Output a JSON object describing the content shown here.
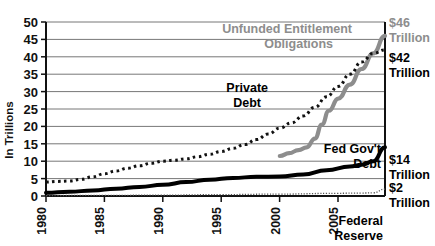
{
  "chart_data": {
    "type": "line",
    "title": "",
    "xlabel": "",
    "ylabel": "In Trillions",
    "xlim": [
      1980,
      2009
    ],
    "ylim": [
      0,
      50
    ],
    "grid": true,
    "legend_position": "inline-annotations",
    "x_ticks": [
      "1980",
      "1985",
      "1990",
      "1995",
      "2000",
      "2005"
    ],
    "x_tick_values": [
      1980,
      1985,
      1990,
      1995,
      2000,
      2005
    ],
    "y_ticks": [
      "0",
      "5",
      "10",
      "15",
      "20",
      "25",
      "30",
      "35",
      "40",
      "45",
      "50"
    ],
    "y_tick_values": [
      0,
      5,
      10,
      15,
      20,
      25,
      30,
      35,
      40,
      45,
      50
    ],
    "series": [
      {
        "name": "Unfunded Entitlement Obligations",
        "style": "thick-gray-line",
        "color": "#8d8d8d",
        "x": [
          2000,
          2000.8,
          2001.6,
          2002.3,
          2003.0,
          2003.6,
          2004.2,
          2005.0,
          2006.0,
          2007.0,
          2008.0,
          2009.0
        ],
        "values": [
          11.5,
          12.3,
          13.2,
          14.0,
          16.5,
          20.5,
          24.5,
          28.0,
          32.0,
          36.5,
          41.0,
          46.0
        ],
        "end_label": "$46 Trillion"
      },
      {
        "name": "Private Debt",
        "style": "dotted-black-line",
        "color": "#111111",
        "x": [
          1980,
          1981,
          1982,
          1983,
          1984,
          1985,
          1986,
          1987,
          1988,
          1989,
          1990,
          1991,
          1992,
          1993,
          1994,
          1995,
          1996,
          1997,
          1998,
          1999,
          2000,
          2001,
          2002,
          2003,
          2004,
          2005,
          2006,
          2007,
          2008,
          2009
        ],
        "values": [
          4.0,
          4.2,
          4.3,
          4.8,
          5.5,
          6.4,
          7.2,
          8.0,
          8.7,
          9.4,
          10.0,
          10.3,
          10.7,
          11.3,
          12.0,
          12.8,
          13.7,
          14.8,
          16.2,
          17.8,
          19.5,
          21.0,
          23.0,
          25.5,
          28.5,
          31.5,
          35.0,
          38.5,
          41.0,
          42.0
        ],
        "end_label": "$42 Trillion"
      },
      {
        "name": "Fed Gov't Debt",
        "style": "thick-black-line",
        "color": "#000000",
        "x": [
          1980,
          1982,
          1984,
          1986,
          1988,
          1990,
          1992,
          1994,
          1996,
          1998,
          2000,
          2002,
          2004,
          2006,
          2007,
          2008,
          2009
        ],
        "values": [
          0.9,
          1.2,
          1.6,
          2.1,
          2.6,
          3.2,
          4.0,
          4.7,
          5.2,
          5.5,
          5.6,
          6.2,
          7.4,
          8.5,
          9.0,
          10.0,
          14.0
        ],
        "end_label": "$14 Trillion"
      },
      {
        "name": "Federal Reserve",
        "style": "thin-dotted-line",
        "color": "#555555",
        "x": [
          1980,
          1985,
          1990,
          1995,
          2000,
          2005,
          2007,
          2008,
          2009
        ],
        "values": [
          0.13,
          0.18,
          0.25,
          0.4,
          0.55,
          0.78,
          0.85,
          0.9,
          2.0
        ],
        "end_label": "$2 Trillion"
      }
    ],
    "annotations": [
      {
        "id": "unfunded-entitlement",
        "text_line1": "Unfunded Entitlement",
        "text_line2": "Obligations",
        "color": "#8d8d8d"
      },
      {
        "id": "private-debt",
        "text_line1": "Private",
        "text_line2": "Debt",
        "color": "#000000"
      },
      {
        "id": "fed-govt-debt",
        "text_line1": "Fed Gov't",
        "text_line2": "Debt",
        "color": "#000000"
      }
    ],
    "side_labels": [
      {
        "id": "label-46t",
        "line1": "$46",
        "line2": "Trillion",
        "color": "#8d8d8d"
      },
      {
        "id": "label-42t",
        "line1": "$42",
        "line2": "Trillion",
        "color": "#000000"
      },
      {
        "id": "label-14t",
        "line1": "$14",
        "line2": "Trillion",
        "color": "#000000"
      },
      {
        "id": "label-2t",
        "line1": "$2",
        "line2": "Trillion",
        "color": "#000000"
      }
    ],
    "source": {
      "line1": "Federal",
      "line2": "Reserve"
    }
  },
  "axis": {
    "y_title": "In Trillions",
    "y_labels": [
      "50",
      "45",
      "40",
      "35",
      "30",
      "25",
      "20",
      "15",
      "10",
      "5",
      "0"
    ],
    "x_labels": [
      "1980",
      "1985",
      "1990",
      "1995",
      "2000",
      "2005"
    ]
  },
  "annotations": {
    "unfunded_line1": "Unfunded Entitlement",
    "unfunded_line2": "Obligations",
    "private_line1": "Private",
    "private_line2": "Debt",
    "fedgov_line1": "Fed Gov't",
    "fedgov_line2": "Debt"
  },
  "side_labels": {
    "t46_line1": "$46",
    "t46_line2": "Trillion",
    "t42_line1": "$42",
    "t42_line2": "Trillion",
    "t14_line1": "$14",
    "t14_line2": "Trillion",
    "t2_line1": "$2",
    "t2_line2": "Trillion"
  },
  "source": {
    "line1": "Federal",
    "line2": "Reserve"
  },
  "colors": {
    "gray_series": "#8d8d8d",
    "black_series": "#000000",
    "grid": "#777777",
    "axis": "#111111"
  }
}
